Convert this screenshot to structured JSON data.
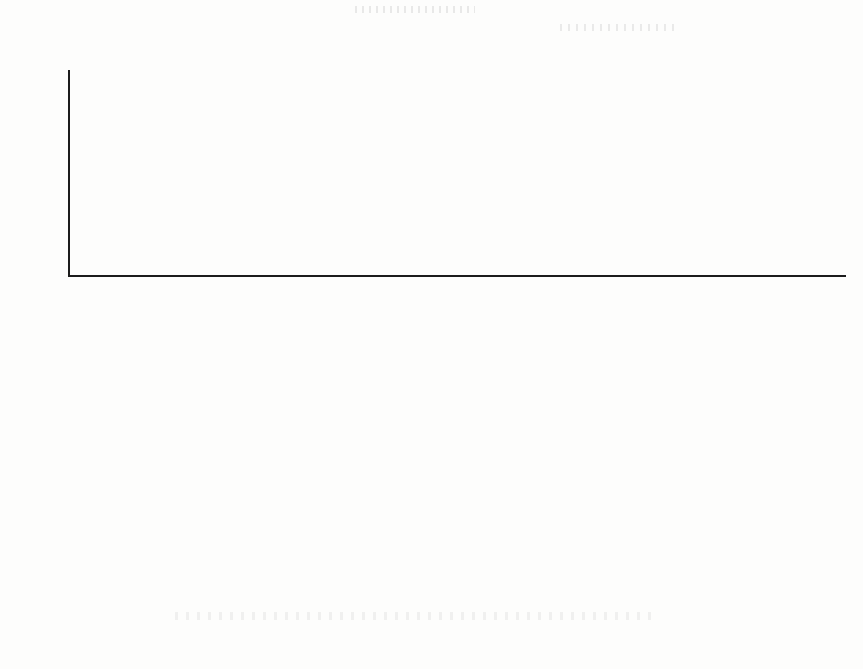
{
  "chart_data": {
    "type": "bar",
    "title": "",
    "subtitle": "",
    "ylabel": "(100 million yuan)",
    "xlabel": "",
    "ylim": [
      0,
      350
    ],
    "yticks": [
      0,
      50,
      100,
      150,
      200,
      250,
      300,
      350
    ],
    "grid": false,
    "legend": null,
    "stacked": true,
    "orientation": "vertical",
    "categories": [
      "Refining and Marketing of Oil and Gas",
      "Coal and Fuel for Construction",
      "Comprehensive Industry",
      "Architecture and Engineering",
      "Multi domain Holding",
      "Food Processing and Meat",
      "Basic Chemical Engineering",
      "Iron and Steel",
      "Harbors and Services",
      "Real Estate Development",
      "Trading;Corporations and Industrial Products",
      "Building Materials",
      "Catalogue Retailing",
      "Industrial Machinery",
      "Electrical Components and Equipment",
      "Construction Products",
      "Services for Environment and Facilities",
      "New Energy Power Generation",
      "Fuel Gas",
      "Computers and Electronics Retailing",
      "Semiconductor Products",
      "Footwear",
      "Gold",
      "Aluminum",
      "Building;Machinery and Heavy Trucks",
      "Services for Investigation and Consultation",
      "Metals and Fabricated Metals",
      "Clothing Costumeand Luxury",
      "Electronic Equipment and Instruments",
      "Metaland Glass Containers",
      "Accesories and Equipment",
      "Dealers of Motor Vehicles",
      "Airport Services",
      "Communication Device",
      "Comprehensive Goods Stores",
      "Advertising",
      "Air Freight and Logistics",
      "Diversified Capital Market",
      "Restaurants",
      "Restaurants",
      "Farm Products",
      "Commercial Printing",
      "Information Technology Consulting Services",
      "Industrial Gas",
      "Internet Software and Services",
      "Road and Railway",
      "Oil and Gas Equipmentand Services"
    ],
    "series": [
      {
        "name": "base",
        "color": "#555053",
        "values": [
          280,
          207,
          105,
          176,
          126,
          88,
          60,
          97,
          55,
          63,
          46,
          63,
          57,
          53,
          47,
          44,
          40,
          39,
          33,
          30,
          24,
          25,
          21,
          13,
          19,
          18,
          16,
          15,
          14,
          13,
          11,
          8,
          10,
          9,
          8,
          8,
          7,
          6,
          5,
          4,
          3,
          3,
          2,
          2,
          1.5,
          1,
          1
        ]
      },
      {
        "name": "top",
        "color": "#141414",
        "values": [
          35,
          0,
          87,
          6,
          56,
          32,
          41,
          0,
          16,
          0,
          17,
          0,
          0,
          0,
          0,
          0,
          0,
          0,
          0,
          4,
          4,
          0,
          0,
          6,
          0,
          0,
          0,
          0,
          3,
          0,
          0,
          2,
          0,
          0,
          0,
          0,
          0,
          0,
          0,
          0,
          0,
          0,
          0,
          0,
          0,
          0,
          0
        ]
      }
    ],
    "totals": [
      315,
      207,
      192,
      182,
      182,
      120,
      101,
      97,
      71,
      63,
      63,
      63,
      57,
      53,
      47,
      44,
      40,
      39,
      33,
      34,
      28,
      25,
      21,
      19,
      19,
      18,
      16,
      15,
      17,
      13,
      11,
      10,
      10,
      9,
      8,
      8,
      7,
      6,
      5,
      4,
      3,
      3,
      2,
      2,
      1.5,
      1,
      1
    ]
  }
}
